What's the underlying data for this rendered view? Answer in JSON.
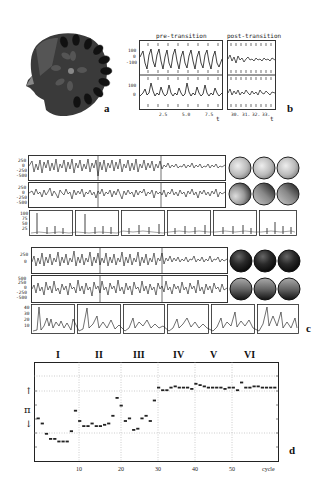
{
  "panel_a": {
    "label": "a",
    "description": "3D head model with radial array of electrode/sensor protrusions",
    "icon": "head-sensor-array-icon"
  },
  "panel_b": {
    "label": "b",
    "pre_title": "pre-transition",
    "post_title": "post-transition",
    "y_ticks_top": [
      "100",
      "0",
      "-100"
    ],
    "y_ticks_bottom": [
      "100",
      "0"
    ],
    "pre_x_ticks": [
      "2.5",
      "5.0",
      "7.5"
    ],
    "post_x_ticks": [
      "30.",
      "31.",
      "32.",
      "33."
    ],
    "x_axis_label": "t"
  },
  "panel_c": {
    "label": "c",
    "block1": {
      "trace1_y_ticks": [
        "250",
        "0",
        "-250",
        "-500"
      ],
      "trace2_y_ticks": [
        "250",
        "0",
        "-250",
        "-500"
      ],
      "spectra_y_ticks": [
        "100",
        "75",
        "50",
        "25"
      ],
      "maps_row1_shade": "light",
      "maps_row2_shade": "mixed"
    },
    "block2": {
      "trace1_y_ticks": [
        "250",
        "0"
      ],
      "trace2_y_ticks": [
        "500",
        "250",
        "0",
        "-250",
        "-500"
      ],
      "spectra_y_ticks": [
        "40",
        "30",
        "20",
        "10"
      ],
      "maps_row1_shade": "dark",
      "maps_row2_shade": "dark-gradient"
    }
  },
  "panel_d": {
    "label": "d",
    "phases": [
      "I",
      "II",
      "III",
      "IV",
      "V",
      "VI"
    ],
    "y_label": "π",
    "x_label": "cycle",
    "x_ticks": [
      "10",
      "20",
      "30",
      "40",
      "50"
    ]
  },
  "chart_data": [
    {
      "type": "line",
      "title": "pre-transition",
      "panel": "b",
      "xlabel": "t",
      "ylabel": "",
      "x_ticks": [
        2.5,
        5.0,
        7.5
      ],
      "y_ticks": [
        100,
        0,
        -100
      ],
      "series": [
        {
          "name": "channel 1",
          "description": "periodic sawtooth-like oscillation, ~8 cycles, amplitude ~±100"
        },
        {
          "name": "channel 2",
          "description": "spiky oscillation around 0 with peaks up to ~100"
        }
      ]
    },
    {
      "type": "line",
      "title": "post-transition",
      "panel": "b",
      "xlabel": "t",
      "x_ticks": [
        30,
        31,
        32,
        33
      ],
      "series": [
        {
          "name": "channel 1",
          "description": "low-amplitude irregular signal"
        },
        {
          "name": "channel 2",
          "description": "low-amplitude irregular signal"
        }
      ]
    },
    {
      "type": "scatter",
      "title": "",
      "panel": "d",
      "xlabel": "cycle",
      "ylabel": "π",
      "x_ticks": [
        10,
        20,
        30,
        40,
        50
      ],
      "xlim": [
        0,
        59
      ],
      "ylim": [
        -1.9,
        2.0
      ],
      "grid": true,
      "phase_labels": [
        {
          "label": "I",
          "x_range": [
            0,
            12
          ]
        },
        {
          "label": "II",
          "x_range": [
            12,
            23
          ]
        },
        {
          "label": "III",
          "x_range": [
            23,
            33
          ]
        },
        {
          "label": "IV",
          "x_range": [
            33,
            43
          ]
        },
        {
          "label": "V",
          "x_range": [
            43,
            53
          ]
        },
        {
          "label": "VI",
          "x_range": [
            53,
            59
          ]
        }
      ],
      "x": [
        1,
        2,
        3,
        4,
        5,
        6,
        7,
        8,
        9,
        10,
        11,
        12,
        13,
        14,
        15,
        16,
        17,
        18,
        19,
        20,
        21,
        22,
        23,
        24,
        25,
        26,
        27,
        28,
        29,
        30,
        31,
        32,
        33,
        34,
        35,
        36,
        37,
        38,
        39,
        40,
        41,
        42,
        43,
        44,
        45,
        46,
        47,
        48,
        49,
        50,
        51,
        52,
        53,
        54,
        55,
        56,
        57,
        58
      ],
      "values": [
        -0.2,
        -0.4,
        -0.8,
        -1.0,
        -1.0,
        -1.1,
        -1.1,
        -1.1,
        -0.7,
        0.1,
        -0.3,
        -0.5,
        -0.5,
        -0.4,
        -0.5,
        -0.5,
        -0.45,
        -0.4,
        -0.1,
        0.6,
        0.3,
        -0.3,
        -0.2,
        -0.65,
        -0.6,
        -0.2,
        -0.1,
        -0.3,
        0.5,
        1.0,
        0.9,
        0.9,
        1.0,
        1.05,
        1.0,
        1.0,
        1.0,
        0.95,
        1.15,
        1.1,
        1.05,
        1.0,
        1.0,
        1.0,
        1.0,
        0.95,
        1.0,
        1.0,
        0.9,
        1.2,
        1.0,
        1.0,
        1.05,
        1.05,
        1.0,
        1.0,
        1.0,
        1.0
      ],
      "note": "values approximate (in units of y-grid; ↑ ≈ +1, ↓ ≈ -0.45); phases I–III cluster low, IV–VI cluster high after cycle ~30"
    }
  ]
}
